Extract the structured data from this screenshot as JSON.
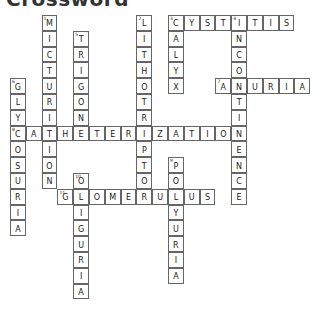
{
  "title": "Crossword",
  "grid": {
    "origin_x": 10,
    "origin_y": 15,
    "cell_size": 15.8
  },
  "words": [
    {
      "number": 1,
      "direction": "down",
      "answer": "MICTURITION",
      "row": 0,
      "col": 2
    },
    {
      "number": 2,
      "direction": "down",
      "answer": "LITHOTRIPTOR",
      "row": 0,
      "col": 8
    },
    {
      "number": 3,
      "direction": "across",
      "answer": "CYSTITIS",
      "row": 0,
      "col": 10
    },
    {
      "number": 3,
      "direction": "down",
      "answer": "CALYX",
      "row": 0,
      "col": 10
    },
    {
      "number": 4,
      "direction": "down",
      "answer": "INCONTINENCE",
      "row": 0,
      "col": 14
    },
    {
      "number": 5,
      "direction": "down",
      "answer": "TRIGONE",
      "row": 1,
      "col": 4
    },
    {
      "number": 6,
      "direction": "down",
      "answer": "GLYCOSURIA",
      "row": 4,
      "col": 0
    },
    {
      "number": 7,
      "direction": "across",
      "answer": "ANURIA",
      "row": 4,
      "col": 13
    },
    {
      "number": 8,
      "direction": "across",
      "answer": "CATHETERIZATION",
      "row": 7,
      "col": 0
    },
    {
      "number": 9,
      "direction": "down",
      "answer": "POLYURIA",
      "row": 9,
      "col": 10
    },
    {
      "number": 10,
      "direction": "down",
      "answer": "OLIGURIA",
      "row": 10,
      "col": 4
    },
    {
      "number": 11,
      "direction": "across",
      "answer": "GLOMERULUS",
      "row": 11,
      "col": 3
    }
  ]
}
